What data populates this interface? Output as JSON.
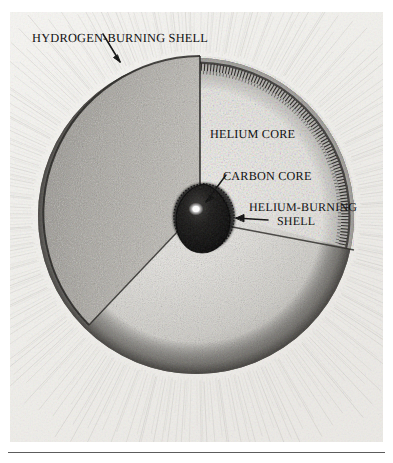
{
  "figure": {
    "kind": "scientific-illustration",
    "medium": "halftone stipple engraving on textured paper",
    "labels": [
      {
        "id": "hydrogen_burning_shell",
        "text": "HYDROGEN-BURNING SHELL",
        "position": "top-left",
        "leader": "arrow pointing down-right to the outer rim of the star"
      },
      {
        "id": "helium_core",
        "text": "HELIUM CORE",
        "position": "upper-right interior of cutaway wedge",
        "leader": "none"
      },
      {
        "id": "carbon_core",
        "text": "CARBON CORE",
        "position": "middle-right",
        "leader": "arrow pointing down-left to the dark central core"
      },
      {
        "id": "helium_burning_shell_line1",
        "text": "HELIUM-BURNING",
        "position": "right of core",
        "leader": "arrow pointing left to the ring around the carbon core"
      },
      {
        "id": "helium_burning_shell_line2",
        "text": "SHELL",
        "position": "right of core, second line",
        "leader": "none"
      }
    ],
    "regions": [
      {
        "name": "stellar envelope",
        "appearance": "large stippled sphere, gradient shading, darkest at the limb"
      },
      {
        "name": "hydrogen-burning shell",
        "appearance": "narrow dashed/hatched arc band just inside the stellar surface"
      },
      {
        "name": "helium core",
        "appearance": "pale finely-stippled interior revealed by the cutaway wedge"
      },
      {
        "name": "helium-burning shell",
        "appearance": "dark hatched ring immediately surrounding the carbon core"
      },
      {
        "name": "carbon core",
        "appearance": "small near-black rounded-triangular mass with a bright specular highlight"
      },
      {
        "name": "cutaway wedge face",
        "appearance": "dark stippled crescent-shaped cut surface on the left of the wedge"
      },
      {
        "name": "background",
        "appearance": "radiating fine pen strokes suggesting glow around the star"
      }
    ],
    "colors": {
      "paper": "#f3f2ef",
      "ink": "#111111",
      "envelope_mid": "#c9c7c2",
      "limb_dark": "#6f6d68",
      "core_dark": "#0b0b0b",
      "highlight": "#ffffff",
      "rule": "#5c5c5c"
    },
    "rule_below_plate": true
  }
}
